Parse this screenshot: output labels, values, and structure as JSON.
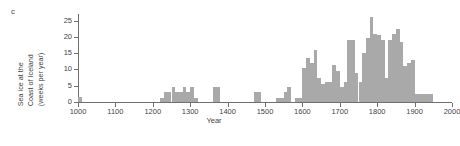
{
  "panel": {
    "label": "c"
  },
  "axes": {
    "ylabel_lines": [
      "Sea ice at the",
      "Coast of Iceland",
      "(weeks per year)"
    ],
    "xlabel": "Year",
    "ytick_labels": [
      "0",
      "5",
      "10",
      "15",
      "20",
      "25"
    ],
    "xtick_labels": [
      "1000",
      "1100",
      "1200",
      "1300",
      "1400",
      "1500",
      "1600",
      "1700",
      "1800",
      "1900",
      "2000"
    ]
  },
  "style": {
    "bar_color": "#a9a9a9",
    "axis_color": "#6f6f6f",
    "text_color": "#3f3f3f"
  },
  "chart_data": {
    "type": "bar",
    "title": "",
    "subtitle": "",
    "xlabel": "Year",
    "ylabel": "Sea ice at the Coast of Iceland (weeks per year)",
    "xlim": [
      1000,
      2000
    ],
    "ylim": [
      0,
      27
    ],
    "ytick_values": [
      0,
      5,
      10,
      15,
      20,
      25
    ],
    "xtick_values": [
      1000,
      1100,
      1200,
      1300,
      1400,
      1500,
      1600,
      1700,
      1800,
      1900,
      2000
    ],
    "grid": false,
    "legend": null,
    "bin_width": 10,
    "annotations": [
      "c"
    ],
    "x": [
      1000,
      1010,
      1020,
      1030,
      1040,
      1050,
      1060,
      1070,
      1080,
      1090,
      1100,
      1110,
      1120,
      1130,
      1140,
      1150,
      1160,
      1170,
      1180,
      1190,
      1200,
      1210,
      1220,
      1230,
      1240,
      1250,
      1260,
      1270,
      1280,
      1290,
      1300,
      1310,
      1320,
      1330,
      1340,
      1350,
      1360,
      1370,
      1380,
      1390,
      1400,
      1410,
      1420,
      1430,
      1440,
      1450,
      1460,
      1470,
      1480,
      1490,
      1500,
      1510,
      1520,
      1530,
      1540,
      1550,
      1560,
      1570,
      1580,
      1590,
      1600,
      1610,
      1620,
      1630,
      1640,
      1650,
      1660,
      1670,
      1680,
      1690,
      1700,
      1710,
      1720,
      1730,
      1740,
      1750,
      1760,
      1770,
      1780,
      1790,
      1800,
      1810,
      1820,
      1830,
      1840,
      1850,
      1860,
      1870,
      1880,
      1890,
      1900,
      1910,
      1920,
      1930,
      1940,
      1950
    ],
    "values": [
      1.5,
      0,
      0,
      0,
      0,
      0,
      0,
      0,
      0,
      0,
      0,
      0,
      0,
      0,
      0,
      0,
      0,
      0,
      0,
      0,
      0,
      0,
      1.2,
      3.0,
      3.0,
      4.5,
      3.0,
      3.0,
      4.5,
      3.0,
      4.5,
      1.2,
      0,
      0,
      0,
      0,
      4.5,
      4.5,
      0,
      0,
      0,
      0,
      0,
      0,
      0,
      0,
      0,
      3.0,
      3.0,
      0,
      0,
      0,
      0,
      1.2,
      1.2,
      3.0,
      4.5,
      0,
      1.2,
      1.2,
      10.5,
      13.5,
      12.0,
      16.0,
      7.5,
      5.5,
      6.0,
      6.0,
      11.5,
      9.5,
      4.5,
      6.0,
      19.0,
      19.0,
      9.0,
      6.0,
      15.0,
      19.5,
      26.0,
      21.0,
      20.5,
      19.0,
      7.5,
      19.0,
      21.0,
      22.5,
      18.5,
      11.0,
      12.0,
      13.0,
      2.5,
      2.5,
      2.5,
      2.5,
      2.5,
      0
    ]
  }
}
